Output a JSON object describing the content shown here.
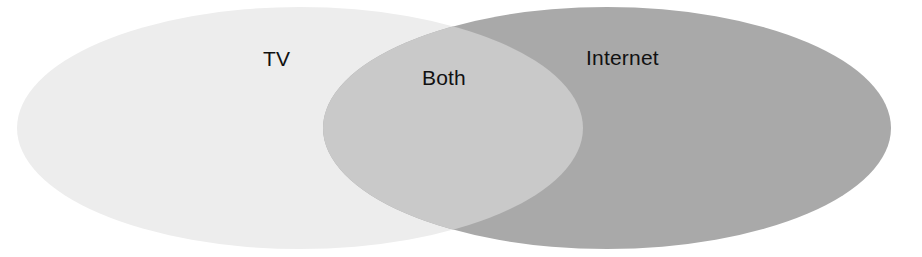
{
  "diagram": {
    "type": "venn",
    "sets": [
      {
        "id": "tv",
        "label": "TV",
        "color": "#ededed",
        "ellipse": {
          "cx": 300,
          "cy": 128,
          "rx": 283,
          "ry": 121
        }
      },
      {
        "id": "internet",
        "label": "Internet",
        "color": "#a9a9a9",
        "ellipse": {
          "cx": 607,
          "cy": 128,
          "rx": 284,
          "ry": 121
        }
      }
    ],
    "intersection": {
      "id": "both",
      "label": "Both",
      "color": "#c9c9c9"
    },
    "labels": {
      "tv": "TV",
      "both": "Both",
      "internet": "Internet"
    }
  }
}
